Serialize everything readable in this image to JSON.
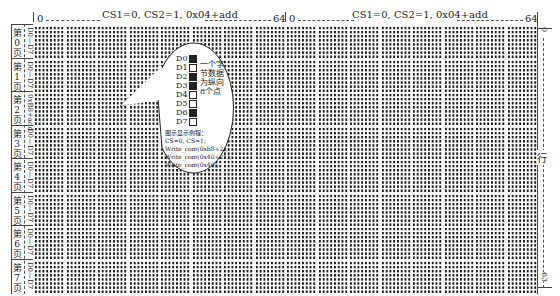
{
  "header": {
    "left_half": {
      "start": "0",
      "end": "64",
      "title": "CS1=0, CS2=1, 0x04+add"
    },
    "right_half": {
      "start": "0",
      "end": "64",
      "title": "CS1=0, CS2=1, 0x04+add"
    }
  },
  "pages": [
    {
      "label_top": "第",
      "label_num": "0",
      "label_bottom": "页",
      "range": "D0—D7"
    },
    {
      "label_top": "第",
      "label_num": "1",
      "label_bottom": "页",
      "range": "D0—D7"
    },
    {
      "label_top": "第",
      "label_num": "2",
      "label_bottom": "页",
      "range": "0xB8+add"
    },
    {
      "label_top": "第",
      "label_num": "3",
      "label_bottom": "页",
      "range": "D0—D7"
    },
    {
      "label_top": "第",
      "label_num": "4",
      "label_bottom": "页",
      "range": "D0—D7"
    },
    {
      "label_top": "第",
      "label_num": "5",
      "label_bottom": "页",
      "range": "D0—D7"
    },
    {
      "label_top": "第",
      "label_num": "6",
      "label_bottom": "页",
      "range": "D0—D7"
    },
    {
      "label_top": "第",
      "label_num": "7",
      "label_bottom": "页",
      "range": "D0—D7"
    }
  ],
  "right_axis": {
    "top": "0",
    "middle": "行",
    "bottom": "63"
  },
  "callout": {
    "bits": [
      {
        "name": "D0",
        "on": true
      },
      {
        "name": "D1",
        "on": false
      },
      {
        "name": "D2",
        "on": true
      },
      {
        "name": "D3",
        "on": true
      },
      {
        "name": "D4",
        "on": false
      },
      {
        "name": "D5",
        "on": false
      },
      {
        "name": "D6",
        "on": true
      },
      {
        "name": "D7",
        "on": false
      }
    ],
    "note_lines": [
      "一个字",
      "节数据",
      "为纵向",
      "8个点"
    ],
    "example_title": "图示显示例程：",
    "example_lines": [
      "CS=0, CS=1;",
      "Write_com(0xb8+2);",
      "Write_com(0x40+21);",
      "Write_com(0x40);"
    ]
  }
}
